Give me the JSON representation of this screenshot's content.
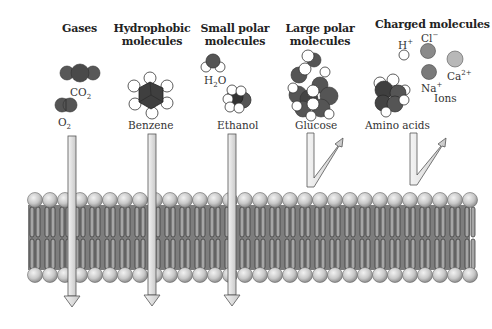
{
  "categories": [
    {
      "id": "gases",
      "heading": [
        "Gases"
      ],
      "molecules": [
        "CO2",
        "O2"
      ],
      "passes": true
    },
    {
      "id": "hydrophobic",
      "heading": [
        "Hydrophobic",
        "molecules"
      ],
      "molecules": [
        "Benzene"
      ],
      "passes": true
    },
    {
      "id": "small-polar",
      "heading": [
        "Small polar",
        "molecules"
      ],
      "molecules": [
        "H2O",
        "Ethanol"
      ],
      "passes": true
    },
    {
      "id": "large-polar",
      "heading": [
        "Large polar",
        "molecules"
      ],
      "molecules": [
        "Glucose"
      ],
      "passes": false
    },
    {
      "id": "charged",
      "heading": [
        "Charged molecules"
      ],
      "molecules": [
        "Amino acids",
        "H+",
        "Cl−",
        "Na+",
        "Ca2+"
      ],
      "passes": false
    }
  ],
  "labels": {
    "gases": "Gases",
    "hydrophobic_1": "Hydrophobic",
    "hydrophobic_2": "molecules",
    "small_polar_1": "Small polar",
    "small_polar_2": "molecules",
    "large_polar_1": "Large polar",
    "large_polar_2": "molecules",
    "charged": "Charged molecules",
    "co2": "CO",
    "co2_sub": "2",
    "o2": "O",
    "o2_sub": "2",
    "h2o_h": "H",
    "h2o_sub": "2",
    "h2o_o": "O",
    "benzene": "Benzene",
    "ethanol": "Ethanol",
    "glucose": "Glucose",
    "amino_acids": "Amino acids",
    "h_plus": "H",
    "h_plus_sup": "+",
    "cl_minus": "Cl",
    "cl_minus_sup": "−",
    "na_plus": "Na",
    "na_plus_sup": "+",
    "ca": "Ca",
    "ca_sup": "2+",
    "ions": "Ions"
  },
  "colors": {
    "background": "#ffffff",
    "dark_atom": "#555555",
    "medium_atom": "#7a7a7a",
    "light_atom": "#b8b8b8",
    "head_fill": "#cfcfcf",
    "tail_fill": "#8c8c8c",
    "arrow_fill": "#e2e2e2",
    "outline": "#444444"
  }
}
